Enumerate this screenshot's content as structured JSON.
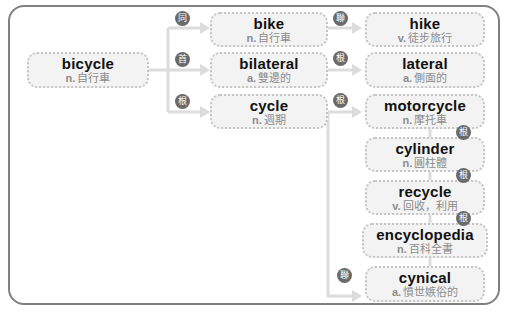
{
  "diagram": {
    "root": {
      "word": "bicycle",
      "pos": "n.",
      "meaning": "自行車"
    },
    "level1": [
      {
        "word": "bike",
        "pos": "n.",
        "meaning": "自行車",
        "relation": "同"
      },
      {
        "word": "bilateral",
        "pos": "a.",
        "meaning": "雙邊的",
        "relation": "首"
      },
      {
        "word": "cycle",
        "pos": "n.",
        "meaning": "週期",
        "relation": "根"
      }
    ],
    "level2": [
      {
        "word": "hike",
        "pos": "v.",
        "meaning": "徒步旅行",
        "relation": "聯"
      },
      {
        "word": "lateral",
        "pos": "a.",
        "meaning": "側面的",
        "relation": "根"
      },
      {
        "word": "motorcycle",
        "pos": "n.",
        "meaning": "摩托車",
        "relation": "根"
      },
      {
        "word": "cylinder",
        "pos": "n.",
        "meaning": "圓柱體",
        "relation": "根"
      },
      {
        "word": "recycle",
        "pos": "v.",
        "meaning": "回收，利用",
        "relation": "根"
      },
      {
        "word": "encyclopedia",
        "pos": "n.",
        "meaning": "百科全書",
        "relation": "根"
      },
      {
        "word": "cynical",
        "pos": "a.",
        "meaning": "憤世嫉俗的",
        "relation": "聯"
      }
    ]
  }
}
